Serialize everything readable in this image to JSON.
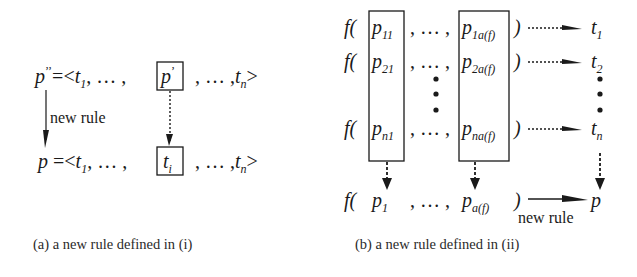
{
  "panel_a": {
    "top_expr": {
      "lhs": "p",
      "lhs_primes": "’’",
      "eq_open": "=<",
      "t": "t",
      "t1_sub": "1",
      "mid": ", … ,",
      "boxed": "p",
      "boxed_prime": "’",
      "after": ", … ,",
      "tn_t": "t",
      "tn_sub": "n",
      "close": ">"
    },
    "bottom_expr": {
      "lhs": "p",
      "eq_open": "=<",
      "t": "t",
      "t1_sub": "1",
      "mid": ", … ,",
      "boxed": "t",
      "boxed_sub": "i",
      "after": ", … ,",
      "tn_t": "t",
      "tn_sub": "n",
      "close": ">"
    },
    "arrow_label": "new rule",
    "caption": "(a) a new rule defined in (i)"
  },
  "panel_b": {
    "func": "f(",
    "ellipsis": ", … ,",
    "close": ")",
    "rows": [
      {
        "first_p": "p",
        "first_sub": "11",
        "last_p": "p",
        "last_sub": "1a(f)",
        "target_t": "t",
        "target_sub": "1"
      },
      {
        "first_p": "p",
        "first_sub": "21",
        "last_p": "p",
        "last_sub": "2a(f)",
        "target_t": "t",
        "target_sub": "2"
      },
      {
        "first_p": "p",
        "first_sub": "n1",
        "last_p": "p",
        "last_sub": "na(f)",
        "target_t": "t",
        "target_sub": "n"
      }
    ],
    "result": {
      "first_p": "p",
      "first_sub": "1",
      "last_p": "p",
      "last_sub": "a(f)",
      "target": "p"
    },
    "arrow_label": "new rule",
    "caption": "(b) a new rule defined in (ii)"
  },
  "colors": {
    "ink": "#1a1a1a",
    "background": "#ffffff"
  }
}
